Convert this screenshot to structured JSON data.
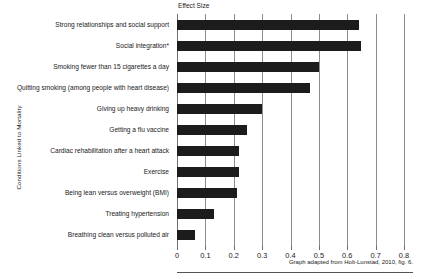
{
  "chart_data": {
    "type": "bar",
    "orientation": "horizontal",
    "title": "Effect Size",
    "xlabel": "Effect Size",
    "ylabel": "Conditions Linked to Mortality",
    "xlim": [
      0,
      0.8
    ],
    "xticks": [
      "0",
      "0.1",
      "0.2",
      "0.3",
      "0.4",
      "0.5",
      "0.6",
      "0.7",
      "0.8"
    ],
    "xtick_values": [
      0,
      0.1,
      0.2,
      0.3,
      0.4,
      0.5,
      0.6,
      0.7,
      0.8
    ],
    "grid": true,
    "legend": false,
    "bar_color": "#1c1c1c",
    "categories": [
      "Strong relationships and social support",
      "Social integration*",
      "Smoking fewer than 15 cigarettes a day",
      "Quitting smoking (among people with heart disease)",
      "Giving up heavy drinking",
      "Getting a flu vaccine",
      "Cardiac rehabilitation after a heart attack",
      "Exercise",
      "Being lean versus  overweight (BMI)",
      "Treating hypertension",
      "Breathing clean versus polluted air"
    ],
    "values": [
      0.64,
      0.65,
      0.5,
      0.47,
      0.3,
      0.245,
      0.22,
      0.22,
      0.21,
      0.13,
      0.065
    ],
    "annotation": "Graph adapted from Holt-Lunstad, 2010, fig. 6."
  }
}
